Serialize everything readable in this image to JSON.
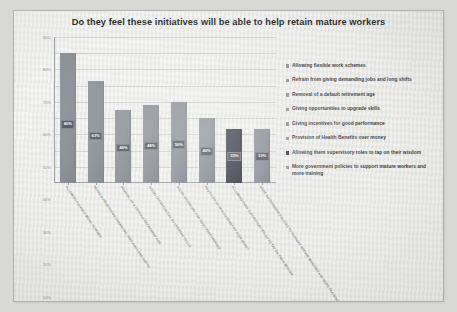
{
  "chart_data": {
    "type": "bar",
    "title": "Do they feel these initiatives will be able to help retain mature workers",
    "xlabel": "",
    "ylabel": "",
    "ylim": [
      0,
      90
    ],
    "grid": true,
    "legend_position": "right",
    "categories": [
      "ALLOWING FLEXIBLE WORK SCHEMES",
      "REFRAIN FROM GIVING DEMANDING JOBS AND LONG SHIFTS",
      "REMOVAL OF A DEFAULT RETIREMENT AGE",
      "GIVING OPPORTUNITIES TO UPGRADE SKILLS",
      "GIVING INCENTIVES FOR GOOD PERFORMANCE",
      "PROVISION OF HEALTH BENEFITS OVER MONEY",
      "ALLOWING THEM SUPERVISORY ROLES TO TAP ON THEIR WISDOM",
      "MORE GOVERNMENT POLICIES TO SUPPORT MATURE WORKERS AND MORE TRAINING"
    ],
    "values": [
      80,
      63,
      45,
      48,
      50,
      40,
      33,
      33
    ],
    "value_labels": [
      "80%",
      "63%",
      "45%",
      "48%",
      "50%",
      "40%",
      "33%",
      "33%"
    ],
    "ytick_labels": [
      "90%",
      "80%",
      "70%",
      "60%",
      "50%",
      "40%",
      "30%",
      "20%",
      "10%",
      "0%"
    ],
    "ytick_values": [
      90,
      80,
      70,
      60,
      50,
      40,
      30,
      20,
      10,
      0
    ],
    "bar_colors": [
      "#8a8f96",
      "#8a8f96",
      "#8a8f96",
      "#8a8f96",
      "#8a8f96",
      "#8a8f96",
      "#343944",
      "#8a8f96"
    ],
    "highlight_index": 6,
    "legend": [
      "Allowing flexible work schemes",
      "Refrain from giving demanding jobs and long shifts",
      "Removal of a default retirement age",
      "Giving opportunities to upgrade skills",
      "Giving incentives for good performance",
      "Provision of Health Benefits over money",
      "Allowing them supervisory roles to tap on their wisdom",
      "More government policies to support mature workers and more training"
    ]
  },
  "colors": {
    "bar": "#8a8f96",
    "bar_highlight": "#343944",
    "value_label_bg": "#4f545c",
    "grid": "#aaadb0",
    "paper": "#ededeb"
  }
}
